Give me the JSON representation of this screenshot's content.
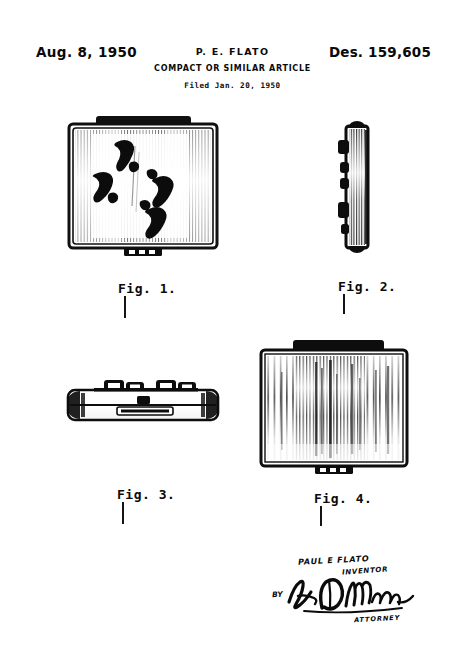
{
  "document": {
    "type": "design-patent-drawing-sheet",
    "date": "Aug. 8, 1950",
    "patent_number": "Des. 159,605",
    "inventor_header": "P. E. FLATO",
    "title": "COMPACT OR SIMILAR ARTICLE",
    "filed": "Filed Jan. 20, 1950",
    "background_color": "#ffffff",
    "ink_color": "#0a0a0a",
    "border_color": "#3a3a3a"
  },
  "figures": [
    {
      "id": "fig1",
      "label": "Fig. 1.",
      "view": "top-plan-view-of-compact-lid",
      "description": "Square compact lid with four bare footprint motifs and engine-turned shading; clasp tab at bottom center"
    },
    {
      "id": "fig2",
      "label": "Fig. 2.",
      "view": "side-edge-elevation",
      "description": "Narrow side edge view showing hinge knuckles along the left edge"
    },
    {
      "id": "fig3",
      "label": "Fig. 3.",
      "view": "front-edge-elevation",
      "description": "Front edge view showing hinge knuckles on top and recessed thumb-piece clasp slot"
    },
    {
      "id": "fig4",
      "label": "Fig. 4.",
      "view": "bottom-plan-view",
      "description": "Bottom of compact with vertical brushed striated texture and clasp tab"
    }
  ],
  "signature": {
    "inventor_name": "PAUL E FLATO",
    "inventor_caption": "INVENTOR",
    "by_label": "BY",
    "attorney_caption": "ATTORNEY"
  }
}
